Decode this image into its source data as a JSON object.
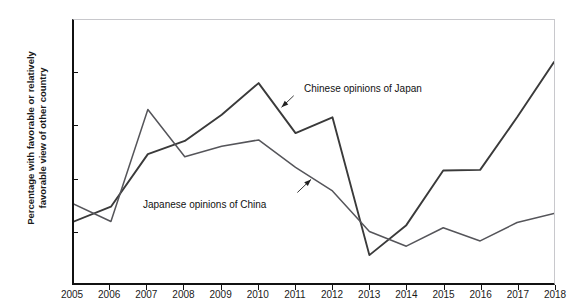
{
  "figure": {
    "top_cut_text": "· · · · · ·",
    "ylabel_line1": "Percentage with favorable or relatively",
    "ylabel_line2": "favorable view of other country"
  },
  "annotations": {
    "chinese": "Chinese opinions of Japan",
    "japanese": "Japanese opinions of China"
  },
  "chart_data": {
    "type": "line",
    "title": "",
    "xlabel": "",
    "ylabel": "Percentage with favorable or relatively favorable view of other country",
    "x": [
      2005,
      2006,
      2007,
      2008,
      2009,
      2010,
      2011,
      2012,
      2013,
      2014,
      2015,
      2016,
      2017,
      2018
    ],
    "xticklabels": [
      "2005",
      "2006",
      "2007",
      "2008",
      "2009",
      "2010",
      "2011",
      "2012",
      "2013",
      "2014",
      "2015",
      "2016",
      "2017",
      "2018"
    ],
    "yticklabels": [
      "0",
      "10",
      "20",
      "30",
      "40",
      "50"
    ],
    "yticks": [
      0,
      10,
      20,
      30,
      40,
      50
    ],
    "ylim": [
      0,
      50
    ],
    "xlim": [
      2005,
      2018
    ],
    "grid": false,
    "legend": "annotated-inline",
    "series": [
      {
        "name": "Chinese opinions of Japan",
        "color": "#3a3a3a",
        "values": [
          11.7,
          14.5,
          24.5,
          27.0,
          32.0,
          38.0,
          28.5,
          31.5,
          5.3,
          11.0,
          21.4,
          21.5,
          31.5,
          42.0
        ]
      },
      {
        "name": "Japanese opinions of China",
        "color": "#55555a",
        "values": [
          15.0,
          11.7,
          33.0,
          24.0,
          26.0,
          27.2,
          22.0,
          17.5,
          9.8,
          7.0,
          10.5,
          8.0,
          11.5,
          13.2
        ]
      }
    ],
    "annotation_arrows": [
      {
        "label": "Chinese opinions of Japan",
        "points_to_year": 2010.6,
        "points_to_value": 33.5
      },
      {
        "label": "Japanese opinions of China",
        "points_to_year": 2011.4,
        "points_to_value": 19.5
      }
    ]
  }
}
